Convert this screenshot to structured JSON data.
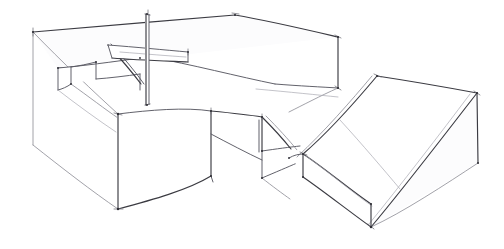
{
  "document": {
    "kind": "hand-drawn engineering sketch",
    "title": "Isometric freehand sketch of a stepped block with slot and ramp wedge",
    "medium": "pencil line drawing on white paper",
    "projection": "isometric / axonometric",
    "width_px": 504,
    "height_px": 249,
    "background_color": "#ffffff",
    "line_color_primary": "#3b3b42",
    "line_color_secondary": "#5a5a63",
    "line_color_light": "#8a8a93",
    "line_color_faint": "#a9a9b2",
    "annotations": [],
    "text_labels": [],
    "dimensions_shown": "none",
    "parts": [
      {
        "id": "part-1",
        "name": "main stepped block",
        "features": [
          "large rectangular base prism",
          "raised rear platform",
          "open horizontal slot / through channel on top-left",
          "small rectangular notch in slot floor",
          "tall thin rib wall at slot right end",
          "recessed step pocket at front right"
        ]
      },
      {
        "id": "part-2",
        "name": "ramp wedge solid",
        "features": [
          "inclined top face sloping down to the left",
          "flat rectangular top landing at upper right",
          "thin plinth / base lip at the bottom front",
          "vertical right end face"
        ]
      }
    ],
    "geometry": {
      "main_block": {
        "top_rear_left": [
          33,
          32
        ],
        "top_rear_peak": [
          235,
          15
        ],
        "top_right": [
          338,
          37
        ],
        "front_corner": [
          118,
          114
        ],
        "bottom_front": [
          118,
          209
        ],
        "bottom_left": [
          33,
          145
        ],
        "right_lower": [
          338,
          88
        ]
      },
      "slot": {
        "floor_near_left": [
          58,
          68
        ],
        "floor_far_right": [
          140,
          58
        ],
        "notch_left": [
          71,
          67
        ],
        "notch_right": [
          96,
          62
        ],
        "notch_depth_px": 17
      },
      "rib_wall": {
        "top": [
          147,
          14
        ],
        "bottom": [
          147,
          105
        ],
        "thickness_px": 3
      },
      "slab": {
        "left": [
          108,
          45
        ],
        "right_top": [
          188,
          52
        ],
        "right_bottom": [
          188,
          62
        ]
      },
      "step_pocket": {
        "left_top": [
          211,
          111
        ],
        "left_bottom": [
          211,
          176
        ],
        "inner_right": [
          262,
          151
        ],
        "inner_bottom": [
          262,
          178
        ]
      },
      "wedge": {
        "apex_top_left": [
          377,
          76
        ],
        "top_right": [
          477,
          93
        ],
        "right_bottom": [
          478,
          163
        ],
        "front_bottom": [
          371,
          227
        ],
        "plinth_left_top": [
          303,
          154
        ],
        "plinth_left_bottom": [
          303,
          177
        ],
        "ridge_low_left": [
          289,
          158
        ]
      }
    }
  }
}
